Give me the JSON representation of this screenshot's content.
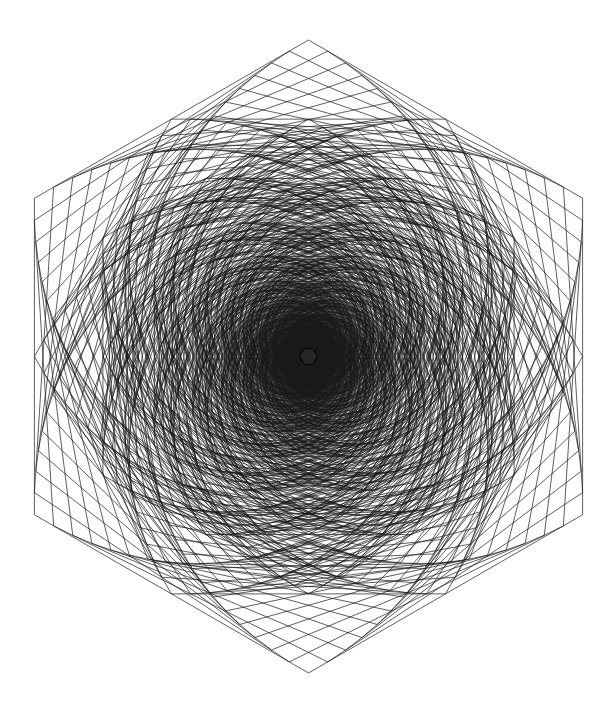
{
  "title": "Hexagonal string-art whirl",
  "artwork": {
    "background": "#ffffff",
    "stroke": "#1a1a1a",
    "stroke_width": 0.7,
    "center": [
      308.5,
      356.5
    ],
    "outer_radius": 316.5,
    "outer_orientation": "pointy-top",
    "layers": [
      {
        "radius": 316.5,
        "rotation_deg": -90,
        "whirls": [
          {
            "t": 0.07,
            "steps": 14
          },
          {
            "t": 0.93,
            "steps": 14
          }
        ]
      },
      {
        "radius": 274.1,
        "rotation_deg": 0,
        "whirls": [
          {
            "t": 0.07,
            "steps": 14
          },
          {
            "t": 0.93,
            "steps": 14
          }
        ]
      },
      {
        "radius": 237.4,
        "rotation_deg": -90,
        "whirls": [
          {
            "t": 0.07,
            "steps": 14
          },
          {
            "t": 0.93,
            "steps": 14
          }
        ]
      },
      {
        "radius": 205.6,
        "rotation_deg": 0,
        "whirls": [
          {
            "t": 0.07,
            "steps": 14
          },
          {
            "t": 0.93,
            "steps": 14
          }
        ]
      },
      {
        "radius": 178.0,
        "rotation_deg": -90,
        "whirls": [
          {
            "t": 0.07,
            "steps": 14
          },
          {
            "t": 0.93,
            "steps": 14
          }
        ]
      },
      {
        "radius": 154.2,
        "rotation_deg": 0,
        "whirls": [
          {
            "t": 0.07,
            "steps": 14
          },
          {
            "t": 0.93,
            "steps": 14
          }
        ]
      },
      {
        "radius": 133.5,
        "rotation_deg": -90,
        "whirls": [
          {
            "t": 0.07,
            "steps": 14
          },
          {
            "t": 0.93,
            "steps": 14
          }
        ]
      },
      {
        "radius": 115.6,
        "rotation_deg": 0,
        "whirls": [
          {
            "t": 0.07,
            "steps": 14
          },
          {
            "t": 0.93,
            "steps": 14
          }
        ]
      },
      {
        "radius": 100.1,
        "rotation_deg": -90,
        "whirls": [
          {
            "t": 0.07,
            "steps": 14
          },
          {
            "t": 0.93,
            "steps": 14
          }
        ]
      },
      {
        "radius": 86.7,
        "rotation_deg": 0,
        "whirls": [
          {
            "t": 0.07,
            "steps": 14
          },
          {
            "t": 0.93,
            "steps": 14
          }
        ]
      },
      {
        "radius": 75.1,
        "rotation_deg": -90,
        "whirls": [
          {
            "t": 0.07,
            "steps": 14
          },
          {
            "t": 0.93,
            "steps": 14
          }
        ]
      },
      {
        "radius": 65.0,
        "rotation_deg": 0,
        "whirls": [
          {
            "t": 0.07,
            "steps": 14
          },
          {
            "t": 0.93,
            "steps": 14
          }
        ]
      },
      {
        "radius": 56.3,
        "rotation_deg": -90,
        "whirls": [
          {
            "t": 0.07,
            "steps": 14
          },
          {
            "t": 0.93,
            "steps": 14
          }
        ]
      },
      {
        "radius": 48.8,
        "rotation_deg": 0,
        "whirls": [
          {
            "t": 0.07,
            "steps": 14
          },
          {
            "t": 0.93,
            "steps": 14
          }
        ]
      },
      {
        "radius": 42.2,
        "rotation_deg": -90,
        "whirls": [
          {
            "t": 0.07,
            "steps": 14
          },
          {
            "t": 0.93,
            "steps": 14
          }
        ]
      },
      {
        "radius": 36.6,
        "rotation_deg": 0,
        "whirls": [
          {
            "t": 0.07,
            "steps": 14
          },
          {
            "t": 0.93,
            "steps": 14
          }
        ]
      },
      {
        "radius": 31.7,
        "rotation_deg": -90,
        "whirls": [
          {
            "t": 0.08,
            "steps": 14
          },
          {
            "t": 0.92,
            "steps": 14
          }
        ]
      },
      {
        "radius": 27.4,
        "rotation_deg": 0,
        "whirls": [
          {
            "t": 0.08,
            "steps": 14
          },
          {
            "t": 0.92,
            "steps": 14
          }
        ]
      },
      {
        "radius": 23.7,
        "rotation_deg": -90,
        "whirls": [
          {
            "t": 0.08,
            "steps": 14
          },
          {
            "t": 0.92,
            "steps": 14
          }
        ]
      },
      {
        "radius": 20.6,
        "rotation_deg": 0,
        "whirls": [
          {
            "t": 0.08,
            "steps": 14
          },
          {
            "t": 0.92,
            "steps": 14
          }
        ]
      },
      {
        "radius": 17.8,
        "rotation_deg": -90,
        "whirls": [
          {
            "t": 0.08,
            "steps": 14
          },
          {
            "t": 0.92,
            "steps": 14
          }
        ]
      },
      {
        "radius": 15.4,
        "rotation_deg": 0,
        "whirls": [
          {
            "t": 0.08,
            "steps": 14
          },
          {
            "t": 0.92,
            "steps": 14
          }
        ]
      }
    ],
    "center_dot": {
      "radius": 9,
      "color": "#000000"
    }
  }
}
